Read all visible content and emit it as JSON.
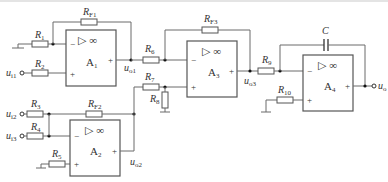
{
  "diagram": {
    "type": "circuit-schematic",
    "opamps": [
      {
        "id": "A1",
        "label": "A",
        "sub": "1",
        "symbol": "▷ ∞"
      },
      {
        "id": "A2",
        "label": "A",
        "sub": "2",
        "symbol": "▷ ∞"
      },
      {
        "id": "A3",
        "label": "A",
        "sub": "3",
        "symbol": "▷ ∞"
      },
      {
        "id": "A4",
        "label": "A",
        "sub": "4",
        "symbol": "▷ ∞"
      }
    ],
    "resistors": [
      {
        "id": "R1",
        "label": "R",
        "sub": "1"
      },
      {
        "id": "R2",
        "label": "R",
        "sub": "2"
      },
      {
        "id": "RF1",
        "label": "R",
        "sub": "F1"
      },
      {
        "id": "R3",
        "label": "R",
        "sub": "3"
      },
      {
        "id": "R4",
        "label": "R",
        "sub": "4"
      },
      {
        "id": "R5",
        "label": "R",
        "sub": "5"
      },
      {
        "id": "RF2",
        "label": "R",
        "sub": "F2"
      },
      {
        "id": "R6",
        "label": "R",
        "sub": "6"
      },
      {
        "id": "R7",
        "label": "R",
        "sub": "7"
      },
      {
        "id": "R8",
        "label": "R",
        "sub": "8"
      },
      {
        "id": "RF3",
        "label": "R",
        "sub": "F3"
      },
      {
        "id": "R9",
        "label": "R",
        "sub": "9"
      },
      {
        "id": "R10",
        "label": "R",
        "sub": "10"
      }
    ],
    "capacitors": [
      {
        "id": "C",
        "label": "C"
      }
    ],
    "signals": [
      {
        "id": "ui1",
        "label": "u",
        "sub": "i1"
      },
      {
        "id": "ui2",
        "label": "u",
        "sub": "i2"
      },
      {
        "id": "ui3",
        "label": "u",
        "sub": "i3"
      },
      {
        "id": "uo1",
        "label": "u",
        "sub": "o1"
      },
      {
        "id": "uo2",
        "label": "u",
        "sub": "o2"
      },
      {
        "id": "uo3",
        "label": "u",
        "sub": "o3"
      },
      {
        "id": "uo",
        "label": "u",
        "sub": "o"
      }
    ],
    "pins": {
      "minus": "−",
      "plus": "+"
    }
  }
}
